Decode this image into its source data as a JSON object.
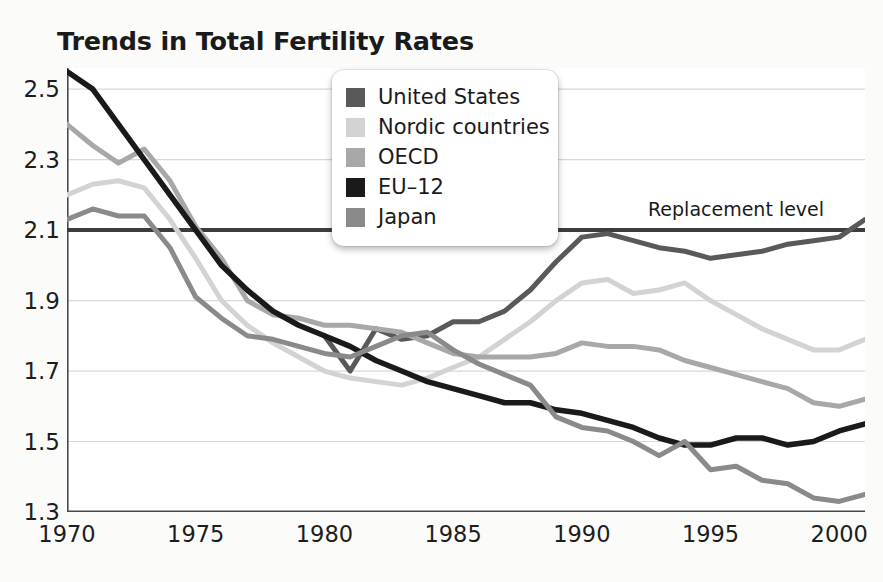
{
  "title": "Trends in Total Fertility Rates",
  "annotation": {
    "replacement_label": "Replacement level",
    "replacement_value": 2.1
  },
  "legend": {
    "position": "top-center",
    "items": [
      {
        "label": "United States",
        "color": "#595959"
      },
      {
        "label": "Nordic countries",
        "color": "#d3d3d3"
      },
      {
        "label": "OECD",
        "color": "#a8a8a8"
      },
      {
        "label": "EU–12",
        "color": "#1a1a1a"
      },
      {
        "label": "Japan",
        "color": "#8a8a8a"
      }
    ]
  },
  "axes": {
    "x_ticks": [
      "1970",
      "1975",
      "1980",
      "1985",
      "1990",
      "1995",
      "2000"
    ],
    "y_ticks": [
      "2.5",
      "2.3",
      "2.1",
      "1.9",
      "1.7",
      "1.5",
      "1.3"
    ],
    "xlim": [
      1970,
      2001
    ],
    "ylim": [
      1.3,
      2.56
    ]
  },
  "chart_data": {
    "type": "line",
    "title": "Trends in Total Fertility Rates",
    "xlabel": "",
    "ylabel": "",
    "xlim": [
      1970,
      2001
    ],
    "ylim": [
      1.3,
      2.56
    ],
    "grid": "horizontal",
    "legend_position": "top-center",
    "x": [
      1970,
      1971,
      1972,
      1973,
      1974,
      1975,
      1976,
      1977,
      1978,
      1979,
      1980,
      1981,
      1982,
      1983,
      1984,
      1985,
      1986,
      1987,
      1988,
      1989,
      1990,
      1991,
      1992,
      1993,
      1994,
      1995,
      1996,
      1997,
      1998,
      1999,
      2000,
      2001
    ],
    "annotations": [
      {
        "text": "Replacement level",
        "y": 2.1,
        "x": 1994
      }
    ],
    "series": [
      {
        "name": "United States",
        "color": "#595959",
        "x": [
          1980,
          1981,
          1982,
          1983,
          1984,
          1985,
          1986,
          1987,
          1988,
          1989,
          1990,
          1991,
          1992,
          1993,
          1994,
          1995,
          1996,
          1997,
          1998,
          1999,
          2000,
          2001
        ],
        "values": [
          1.8,
          1.7,
          1.82,
          1.79,
          1.8,
          1.84,
          1.84,
          1.87,
          1.93,
          2.01,
          2.08,
          2.09,
          2.07,
          2.05,
          2.04,
          2.02,
          2.03,
          2.04,
          2.06,
          2.07,
          2.08,
          2.13
        ]
      },
      {
        "name": "Nordic countries",
        "color": "#d3d3d3",
        "x": [
          1970,
          1971,
          1972,
          1973,
          1974,
          1975,
          1976,
          1977,
          1978,
          1979,
          1980,
          1981,
          1982,
          1983,
          1984,
          1985,
          1986,
          1987,
          1988,
          1989,
          1990,
          1991,
          1992,
          1993,
          1994,
          1995,
          1996,
          1997,
          1998,
          1999,
          2000,
          2001
        ],
        "values": [
          2.2,
          2.23,
          2.24,
          2.22,
          2.13,
          2.02,
          1.9,
          1.83,
          1.78,
          1.74,
          1.7,
          1.68,
          1.67,
          1.66,
          1.68,
          1.71,
          1.74,
          1.79,
          1.84,
          1.9,
          1.95,
          1.96,
          1.92,
          1.93,
          1.95,
          1.9,
          1.86,
          1.82,
          1.79,
          1.76,
          1.76,
          1.79
        ]
      },
      {
        "name": "OECD",
        "color": "#a8a8a8",
        "x": [
          1970,
          1971,
          1972,
          1973,
          1974,
          1975,
          1976,
          1977,
          1978,
          1979,
          1980,
          1981,
          1982,
          1983,
          1984,
          1985,
          1986,
          1987,
          1988,
          1989,
          1990,
          1991,
          1992,
          1993,
          1994,
          1995,
          1996,
          1997,
          1998,
          1999,
          2000,
          2001
        ],
        "values": [
          2.4,
          2.34,
          2.29,
          2.33,
          2.24,
          2.11,
          2.02,
          1.9,
          1.86,
          1.85,
          1.83,
          1.83,
          1.82,
          1.81,
          1.78,
          1.75,
          1.74,
          1.74,
          1.74,
          1.75,
          1.78,
          1.77,
          1.77,
          1.76,
          1.73,
          1.71,
          1.69,
          1.67,
          1.65,
          1.61,
          1.6,
          1.62
        ]
      },
      {
        "name": "EU–12",
        "color": "#1a1a1a",
        "x": [
          1970,
          1971,
          1972,
          1973,
          1974,
          1975,
          1976,
          1977,
          1978,
          1979,
          1980,
          1981,
          1982,
          1983,
          1984,
          1985,
          1986,
          1987,
          1988,
          1989,
          1990,
          1991,
          1992,
          1993,
          1994,
          1995,
          1996,
          1997,
          1998,
          1999,
          2000,
          2001
        ],
        "values": [
          2.55,
          2.5,
          2.4,
          2.3,
          2.2,
          2.1,
          2.0,
          1.93,
          1.87,
          1.83,
          1.8,
          1.77,
          1.73,
          1.7,
          1.67,
          1.65,
          1.63,
          1.61,
          1.61,
          1.59,
          1.58,
          1.56,
          1.54,
          1.51,
          1.49,
          1.49,
          1.51,
          1.51,
          1.49,
          1.5,
          1.53,
          1.55
        ]
      },
      {
        "name": "Japan",
        "color": "#8a8a8a",
        "x": [
          1970,
          1971,
          1972,
          1973,
          1974,
          1975,
          1976,
          1977,
          1978,
          1979,
          1980,
          1981,
          1982,
          1983,
          1984,
          1985,
          1986,
          1987,
          1988,
          1989,
          1990,
          1991,
          1992,
          1993,
          1994,
          1995,
          1996,
          1997,
          1998,
          1999,
          2000,
          2001
        ],
        "values": [
          2.13,
          2.16,
          2.14,
          2.14,
          2.05,
          1.91,
          1.85,
          1.8,
          1.79,
          1.77,
          1.75,
          1.74,
          1.77,
          1.8,
          1.81,
          1.76,
          1.72,
          1.69,
          1.66,
          1.57,
          1.54,
          1.53,
          1.5,
          1.46,
          1.5,
          1.42,
          1.43,
          1.39,
          1.38,
          1.34,
          1.33,
          1.35
        ]
      }
    ]
  }
}
